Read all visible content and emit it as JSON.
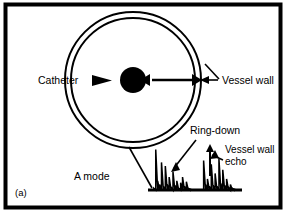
{
  "figure": {
    "panel_tag": "(a)",
    "mode_label": "A mode",
    "frame_color": "#000000",
    "background_color": "#ffffff",
    "ink_color": "#000000"
  },
  "labels": {
    "catheter": "Catheter",
    "vessel_wall": "Vessel wall",
    "ring_down": "Ring-down",
    "vessel_wall_echo_line1": "Vessel wall",
    "vessel_wall_echo_line2": "echo"
  },
  "chart_data": {
    "type": "line",
    "title": "A mode",
    "xlabel": "",
    "ylabel": "",
    "grid": false,
    "legend": "none",
    "xlim": [
      148,
      242
    ],
    "ylim": [
      0,
      50
    ],
    "annotations": [
      {
        "text": "Ring-down",
        "points_to": "left spike cluster"
      },
      {
        "text": "Vessel wall echo",
        "points_to": "right spike cluster"
      }
    ],
    "series": [
      {
        "name": "A-mode echo amplitude",
        "x": [
          150,
          152,
          154,
          156,
          158,
          160,
          162,
          164,
          166,
          168,
          170,
          172,
          174,
          176,
          178,
          180,
          182,
          184,
          186,
          188,
          190,
          192,
          194,
          196,
          198,
          200,
          202,
          204,
          206,
          208,
          210,
          212,
          214,
          216,
          218,
          220,
          222,
          224,
          226,
          228,
          230,
          232,
          234,
          236,
          238,
          240
        ],
        "values": [
          0,
          2,
          44,
          10,
          6,
          30,
          4,
          26,
          6,
          14,
          3,
          20,
          5,
          10,
          2,
          8,
          14,
          4,
          9,
          2,
          1,
          0,
          0,
          0,
          0,
          0,
          0,
          32,
          6,
          12,
          4,
          28,
          5,
          18,
          4,
          34,
          7,
          22,
          5,
          12,
          3,
          6,
          2,
          1,
          0,
          0
        ]
      }
    ],
    "clusters": [
      {
        "name": "ring-down",
        "x_range": [
          150,
          192
        ],
        "peak_value": 44
      },
      {
        "name": "vessel-wall-echo",
        "x_range": [
          204,
          240
        ],
        "peak_value": 34
      }
    ]
  },
  "geometry": {
    "vessel_outer_radius": 68,
    "vessel_inner_radius": 62,
    "vessel_center_x": 133,
    "vessel_center_y": 80,
    "catheter_radius": 13
  }
}
